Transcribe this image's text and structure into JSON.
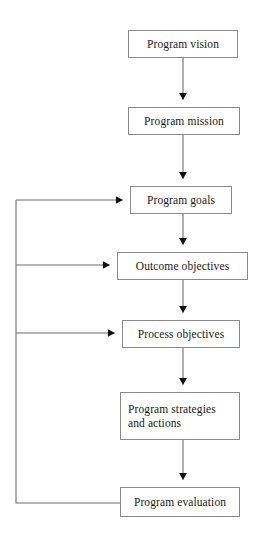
{
  "diagram": {
    "title_text": "",
    "background_color": "#ffffff",
    "box_border_color": "#8a8a8a",
    "line_color": "#6e6e6e",
    "arrowhead_color": "#111111",
    "text_color": "#1a1a1a",
    "nodes": [
      {
        "id": "program-vision",
        "label": "Program vision",
        "x": 128,
        "y": 30,
        "w": 110,
        "h": 28,
        "multiline": false
      },
      {
        "id": "program-mission",
        "label": "Program mission",
        "x": 128,
        "y": 107,
        "w": 112,
        "h": 28,
        "multiline": false
      },
      {
        "id": "program-goals",
        "label": "Program goals",
        "x": 130,
        "y": 186,
        "w": 102,
        "h": 28,
        "multiline": false
      },
      {
        "id": "outcome-objectives",
        "label": "Outcome objectives",
        "x": 117,
        "y": 252,
        "w": 131,
        "h": 28,
        "multiline": false
      },
      {
        "id": "process-objectives",
        "label": "Process objectives",
        "x": 122,
        "y": 320,
        "w": 118,
        "h": 28,
        "multiline": false
      },
      {
        "id": "program-strategies",
        "label": "Program strategies and actions",
        "x": 120,
        "y": 392,
        "w": 120,
        "h": 48,
        "multiline": true,
        "line1": "Program strategies",
        "line2": "and actions"
      },
      {
        "id": "program-evaluation",
        "label": "Program evaluation",
        "x": 120,
        "y": 487,
        "w": 120,
        "h": 30,
        "multiline": false
      }
    ],
    "forward_edges": [
      {
        "from": "program-vision",
        "to": "program-mission",
        "kind": "down-arrow"
      },
      {
        "from": "program-mission",
        "to": "program-goals",
        "kind": "down-arrow"
      },
      {
        "from": "program-goals",
        "to": "outcome-objectives",
        "kind": "down-arrow"
      },
      {
        "from": "outcome-objectives",
        "to": "process-objectives",
        "kind": "down-arrow"
      },
      {
        "from": "process-objectives",
        "to": "program-strategies",
        "kind": "down-arrow"
      },
      {
        "from": "program-strategies",
        "to": "program-evaluation",
        "kind": "down-arrow"
      }
    ],
    "feedback_edges": [
      {
        "from": "program-evaluation",
        "to": "program-goals",
        "kind": "left-bus-arrow"
      },
      {
        "from": "program-evaluation",
        "to": "outcome-objectives",
        "kind": "left-bus-arrow"
      },
      {
        "from": "program-evaluation",
        "to": "process-objectives",
        "kind": "left-bus-arrow"
      }
    ]
  }
}
